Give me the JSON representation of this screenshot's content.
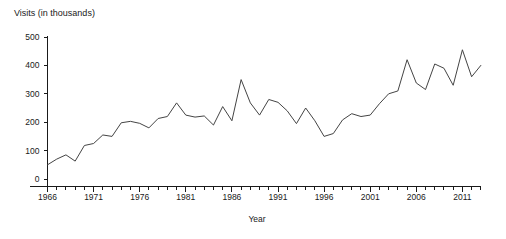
{
  "chart_data": {
    "type": "line",
    "title": "Visits (in thousands)",
    "ylabel": "Visits (in thousands)",
    "xlabel": "Year",
    "ylim": [
      0,
      520
    ],
    "xlim": [
      1965,
      2015
    ],
    "grid": false,
    "legend": null,
    "ytick_labels": [
      "0",
      "100",
      "200",
      "300",
      "400",
      "500"
    ],
    "ytick_values": [
      0,
      100,
      200,
      300,
      400,
      500
    ],
    "xtick_labels": [
      "1966",
      "1971",
      "1976",
      "1981",
      "1986",
      "1991",
      "1996",
      "2001",
      "2006",
      "2011"
    ],
    "xtick_values": [
      1966,
      1971,
      1976,
      1981,
      1986,
      1991,
      1996,
      2001,
      2006,
      2011
    ],
    "line_color": "#444444",
    "axis_color": "#1a1a1a",
    "x": [
      1966,
      1967,
      1968,
      1969,
      1970,
      1971,
      1972,
      1973,
      1974,
      1975,
      1976,
      1977,
      1978,
      1979,
      1980,
      1981,
      1982,
      1983,
      1984,
      1985,
      1986,
      1987,
      1988,
      1989,
      1990,
      1991,
      1992,
      1993,
      1994,
      1995,
      1996,
      1997,
      1998,
      1999,
      2000,
      2001,
      2002,
      2003,
      2004,
      2005,
      2006,
      2007,
      2008,
      2009,
      2010,
      2011,
      2012,
      2013
    ],
    "values": [
      50,
      70,
      85,
      63,
      118,
      125,
      155,
      150,
      198,
      203,
      196,
      180,
      213,
      220,
      268,
      225,
      218,
      222,
      190,
      255,
      205,
      350,
      268,
      225,
      280,
      270,
      240,
      195,
      250,
      205,
      150,
      160,
      208,
      230,
      220,
      225,
      265,
      300,
      310,
      420,
      338,
      315,
      405,
      390,
      330,
      455,
      360,
      400
    ],
    "series": [
      {
        "name": "Visits",
        "values": [
          50,
          70,
          85,
          63,
          118,
          125,
          155,
          150,
          198,
          203,
          196,
          180,
          213,
          220,
          268,
          225,
          218,
          222,
          190,
          255,
          205,
          350,
          268,
          225,
          280,
          270,
          240,
          195,
          250,
          205,
          150,
          160,
          208,
          230,
          220,
          225,
          265,
          300,
          310,
          420,
          338,
          315,
          405,
          390,
          330,
          455,
          360,
          400
        ]
      }
    ]
  }
}
